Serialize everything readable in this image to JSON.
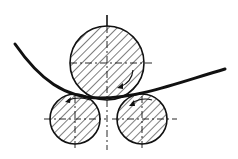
{
  "diagram": {
    "colors": {
      "ink": "#111111",
      "background": "#ffffff"
    },
    "rolls": [
      {
        "id": "top-roll",
        "cx": 107,
        "cy": 63,
        "r": 37,
        "rotation": "clockwise"
      },
      {
        "id": "bottom-left-roll",
        "cx": 75,
        "cy": 119,
        "r": 25,
        "rotation": "counterclockwise"
      },
      {
        "id": "bottom-right-roll",
        "cx": 142,
        "cy": 119,
        "r": 25,
        "rotation": "counterclockwise"
      }
    ],
    "sheet": {
      "start": [
        15,
        44
      ],
      "lowest": [
        100,
        98
      ],
      "end": [
        225,
        69
      ]
    }
  }
}
